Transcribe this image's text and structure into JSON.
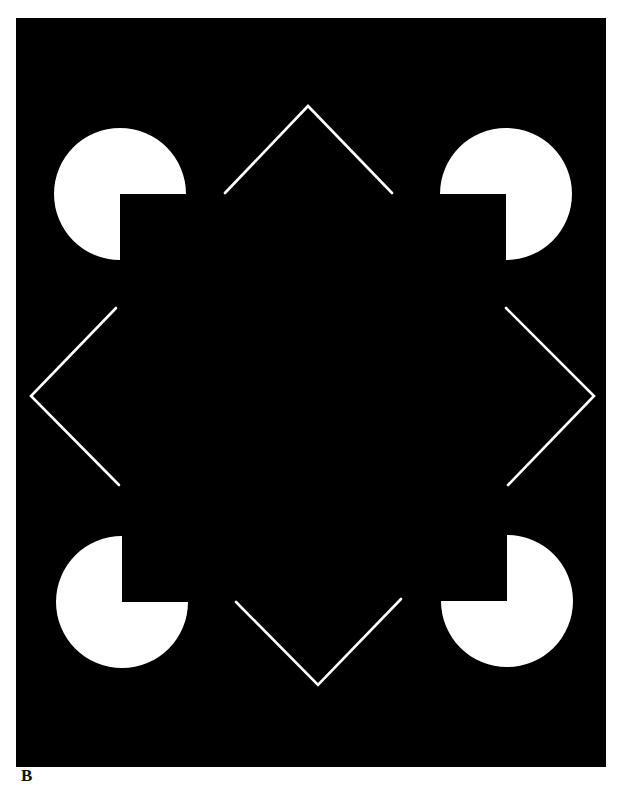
{
  "figure": {
    "panel_label": "B",
    "background_color": "#ffffff",
    "panel_color": "#000000",
    "shape_color": "#ffffff",
    "panel": {
      "x": 16,
      "y": 18,
      "width": 590,
      "height": 749
    },
    "pacmen": [
      {
        "name": "pacman-top-left",
        "cx": 120,
        "cy": 194,
        "r": 66,
        "missing_quadrant": "bottom-right"
      },
      {
        "name": "pacman-top-right",
        "cx": 506,
        "cy": 194,
        "r": 66,
        "missing_quadrant": "bottom-left"
      },
      {
        "name": "pacman-bottom-left",
        "cx": 122,
        "cy": 602,
        "r": 66,
        "missing_quadrant": "top-right"
      },
      {
        "name": "pacman-bottom-right",
        "cx": 507,
        "cy": 601,
        "r": 66,
        "missing_quadrant": "top-left"
      }
    ],
    "chevrons": [
      {
        "name": "chevron-top",
        "points": "225,193 308,106 392,193"
      },
      {
        "name": "chevron-left",
        "points": "116,308 31,396 119,485"
      },
      {
        "name": "chevron-right",
        "points": "506,308 594,396 508,485"
      },
      {
        "name": "chevron-bottom",
        "points": "236,602 318,685 401,599"
      }
    ]
  }
}
